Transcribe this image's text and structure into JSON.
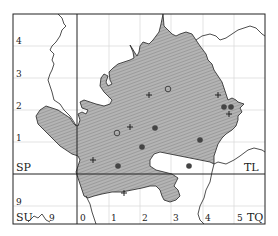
{
  "map": {
    "type": "distribution map",
    "grid_squares": [
      "SP",
      "TL",
      "SU",
      "TQ"
    ],
    "y_tick_labels": [
      "4",
      "3",
      "2",
      "1",
      "9"
    ],
    "x_tick_labels_bottom": [
      "9",
      "0",
      "1",
      "2",
      "3",
      "4",
      "5"
    ],
    "colors": {
      "region_fill": "#aaaaaa",
      "hatch": "#8c8c8c",
      "border": "#222222",
      "gridline": "#d9d9d9",
      "frame": "#333333",
      "dot": "#444444"
    },
    "legend_symbols": {
      "filled_circle": "recent record",
      "open_circle": "older record",
      "plus": "pre-1930 / unconfirmed record"
    },
    "points": {
      "filled_circles": [
        {
          "x": 155,
          "y": 128
        },
        {
          "x": 142,
          "y": 147
        },
        {
          "x": 118,
          "y": 166
        },
        {
          "x": 189,
          "y": 166
        },
        {
          "x": 200,
          "y": 140
        },
        {
          "x": 225,
          "y": 107
        },
        {
          "x": 231,
          "y": 107
        }
      ],
      "open_circles": [
        {
          "x": 168,
          "y": 89
        },
        {
          "x": 117,
          "y": 133
        }
      ],
      "plus_marks": [
        {
          "x": 149,
          "y": 95
        },
        {
          "x": 130,
          "y": 127
        },
        {
          "x": 218,
          "y": 95
        },
        {
          "x": 93,
          "y": 160
        },
        {
          "x": 124,
          "y": 193
        },
        {
          "x": 229,
          "y": 113
        }
      ]
    }
  },
  "labels": {
    "y4": "4",
    "y3": "3",
    "y2": "2",
    "y1": "1",
    "y9": "9",
    "sp": "SP",
    "tl": "TL",
    "su": "SU",
    "tq": "TQ",
    "x9": "9",
    "x0": "0",
    "x1": "1",
    "x2": "2",
    "x3": "3",
    "x4": "4",
    "x5": "5"
  }
}
